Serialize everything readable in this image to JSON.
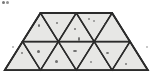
{
  "figure": {
    "name": "triangular-grid-trapezoid",
    "canvas": {
      "width": 152,
      "height": 83,
      "background": "#ffffff"
    },
    "style": {
      "fill": "#e7e7e5",
      "stroke": "#2b2b2b",
      "stroke_width": 1.6,
      "thin_stroke_width": 1.1,
      "speck_color": "#4a4a4a"
    },
    "geometry": {
      "side_length": 35.8,
      "triangle_height": 28.7,
      "rows": [
        {
          "name": "top-row",
          "y_top": 13,
          "y_bottom": 41.6,
          "x_start": 22.6,
          "up_triangles": 3,
          "down_triangles": 2
        },
        {
          "name": "bottom-row",
          "y_top": 41.6,
          "y_bottom": 70.2,
          "x_start": 4.7,
          "up_triangles": 4,
          "down_triangles": 3
        }
      ]
    },
    "triangles": [
      {
        "id": "t1",
        "row": "top-row",
        "orientation": "up",
        "points": "22.6,41.6 40.5,13 58.4,41.6"
      },
      {
        "id": "t2",
        "row": "top-row",
        "orientation": "down",
        "points": "40.5,13 76.3,13 58.4,41.6"
      },
      {
        "id": "t3",
        "row": "top-row",
        "orientation": "up",
        "points": "58.4,41.6 76.3,13 94.2,41.6"
      },
      {
        "id": "t4",
        "row": "top-row",
        "orientation": "down",
        "points": "76.3,13 112.1,13 94.2,41.6"
      },
      {
        "id": "t5",
        "row": "top-row",
        "orientation": "up",
        "points": "94.2,41.6 112.1,13 130.0,41.6"
      },
      {
        "id": "b1",
        "row": "bottom-row",
        "orientation": "up",
        "points": "4.7,70.2 22.6,41.6 40.5,70.2"
      },
      {
        "id": "b2",
        "row": "bottom-row",
        "orientation": "down",
        "points": "22.6,41.6 58.4,41.6 40.5,70.2"
      },
      {
        "id": "b3",
        "row": "bottom-row",
        "orientation": "up",
        "points": "40.5,70.2 58.4,41.6 76.3,70.2"
      },
      {
        "id": "b4",
        "row": "bottom-row",
        "orientation": "down",
        "points": "58.4,41.6 94.2,41.6 76.3,70.2"
      },
      {
        "id": "b5",
        "row": "bottom-row",
        "orientation": "up",
        "points": "76.3,70.2 94.2,41.6 112.1,70.2"
      },
      {
        "id": "b6",
        "row": "bottom-row",
        "orientation": "down",
        "points": "94.2,41.6 130.0,41.6 112.1,70.2"
      },
      {
        "id": "b7",
        "row": "bottom-row",
        "orientation": "up",
        "points": "112.1,70.2 130.0,41.6 147.9,70.2"
      }
    ],
    "outline": "4.7,70.2 22.6,41.6 40.5,13 76.3,13 112.1,13 130.0,41.6 147.9,70.2",
    "specks": [
      {
        "x": 2,
        "y": 1,
        "w": 3,
        "h": 3,
        "opacity": 0.75
      },
      {
        "x": 6,
        "y": 1,
        "w": 3,
        "h": 3,
        "opacity": 0.6
      },
      {
        "x": 38,
        "y": 24,
        "w": 2,
        "h": 3,
        "opacity": 0.8
      },
      {
        "x": 56,
        "y": 22,
        "w": 2,
        "h": 2,
        "opacity": 0.7
      },
      {
        "x": 74,
        "y": 28,
        "w": 2,
        "h": 2,
        "opacity": 0.75
      },
      {
        "x": 88,
        "y": 18,
        "w": 2,
        "h": 2,
        "opacity": 0.65
      },
      {
        "x": 93,
        "y": 20,
        "w": 2,
        "h": 2,
        "opacity": 0.55
      },
      {
        "x": 104,
        "y": 23,
        "w": 2,
        "h": 2,
        "opacity": 0.7
      },
      {
        "x": 78,
        "y": 37,
        "w": 2,
        "h": 4,
        "opacity": 0.8
      },
      {
        "x": 21,
        "y": 52,
        "w": 2,
        "h": 2,
        "opacity": 0.7
      },
      {
        "x": 37,
        "y": 50,
        "w": 3,
        "h": 3,
        "opacity": 0.8
      },
      {
        "x": 55,
        "y": 60,
        "w": 3,
        "h": 3,
        "opacity": 0.75
      },
      {
        "x": 73,
        "y": 50,
        "w": 4,
        "h": 2,
        "opacity": 0.8
      },
      {
        "x": 90,
        "y": 61,
        "w": 2,
        "h": 2,
        "opacity": 0.6
      },
      {
        "x": 106,
        "y": 52,
        "w": 3,
        "h": 2,
        "opacity": 0.75
      },
      {
        "x": 125,
        "y": 63,
        "w": 2,
        "h": 2,
        "opacity": 0.7
      },
      {
        "x": 12,
        "y": 46,
        "w": 2,
        "h": 2,
        "opacity": 0.45
      },
      {
        "x": 146,
        "y": 46,
        "w": 2,
        "h": 2,
        "opacity": 0.4
      }
    ]
  }
}
